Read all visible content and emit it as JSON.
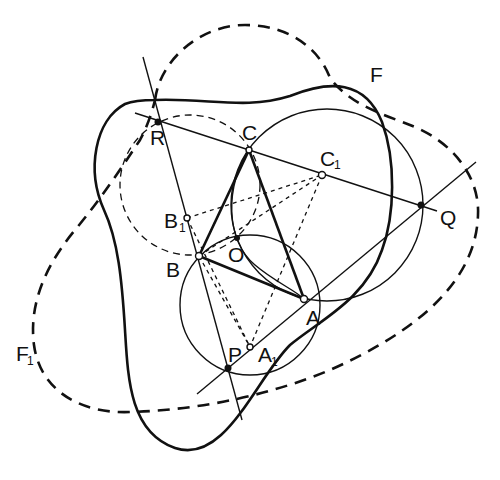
{
  "diagram": {
    "title": "",
    "labels": {
      "R": "R",
      "C": "C",
      "C1_main": "C",
      "C1_sub": "1",
      "F": "F",
      "Q": "Q",
      "B1_main": "B",
      "B1_sub": "1",
      "B": "B",
      "O": "O",
      "A": "A",
      "P": "P",
      "A1_main": "A",
      "A1_sub": "1",
      "F1_main": "F",
      "F1_sub": "1"
    },
    "points": [
      {
        "name": "R",
        "x": 158,
        "y": 122,
        "style": "filled"
      },
      {
        "name": "C",
        "x": 249,
        "y": 150,
        "style": "open"
      },
      {
        "name": "C1",
        "x": 322,
        "y": 175,
        "style": "open"
      },
      {
        "name": "Q",
        "x": 421,
        "y": 205,
        "style": "filled"
      },
      {
        "name": "B1",
        "x": 187,
        "y": 218,
        "style": "open"
      },
      {
        "name": "B",
        "x": 199,
        "y": 256,
        "style": "open"
      },
      {
        "name": "O",
        "x": 237,
        "y": 238,
        "style": "filled"
      },
      {
        "name": "A",
        "x": 304,
        "y": 299,
        "style": "open"
      },
      {
        "name": "P",
        "x": 228,
        "y": 368,
        "style": "filled"
      },
      {
        "name": "A1",
        "x": 250,
        "y": 347,
        "style": "open"
      }
    ],
    "curves": [
      {
        "name": "F",
        "style": "solid-thick",
        "description": "closed curve of constant-width type"
      },
      {
        "name": "F1",
        "style": "dashed-thick",
        "description": "closed curve"
      },
      {
        "name": "circle-B1",
        "style": "dashed-thin",
        "center": "B1"
      },
      {
        "name": "circle-C1",
        "style": "solid-thin",
        "center": "C1"
      },
      {
        "name": "circle-A1",
        "style": "solid-thin",
        "center": "A1"
      }
    ]
  }
}
